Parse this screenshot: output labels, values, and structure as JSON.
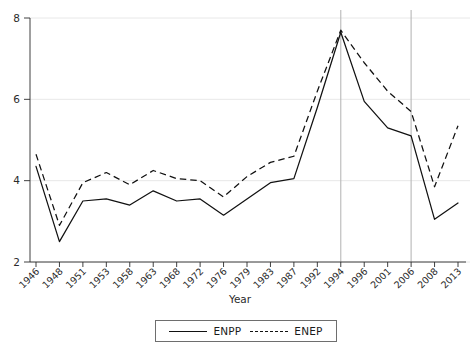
{
  "chart_data": {
    "type": "line",
    "title": "",
    "xlabel": "Year",
    "ylabel": "",
    "grid": true,
    "legend_position": "bottom",
    "ylim": [
      2,
      8
    ],
    "yticks": [
      2,
      4,
      6,
      8
    ],
    "categories": [
      "1946",
      "1948",
      "1951",
      "1953",
      "1958",
      "1963",
      "1968",
      "1972",
      "1976",
      "1979",
      "1983",
      "1987",
      "1992",
      "1994",
      "1996",
      "2001",
      "2006",
      "2008",
      "2013"
    ],
    "reference_lines": [
      "1994",
      "2006"
    ],
    "series": [
      {
        "name": "ENPP",
        "style": "solid",
        "values": [
          4.35,
          2.5,
          3.5,
          3.55,
          3.4,
          3.75,
          3.5,
          3.55,
          3.15,
          3.55,
          3.95,
          4.05,
          5.8,
          7.65,
          5.95,
          5.3,
          5.1,
          3.05,
          3.45
        ]
      },
      {
        "name": "ENEP",
        "style": "dashed",
        "values": [
          4.65,
          2.9,
          3.95,
          4.2,
          3.9,
          4.25,
          4.05,
          4.0,
          3.6,
          4.1,
          4.45,
          4.6,
          6.2,
          7.7,
          6.9,
          6.2,
          5.7,
          3.85,
          5.35
        ]
      }
    ],
    "colors": {
      "series_line": "#111111",
      "grid": "#e2e2e2",
      "axis": "#2b2b2b",
      "reference_line": "#b8b8b8",
      "background": "#ffffff"
    }
  },
  "legend": {
    "entries": [
      {
        "label": "ENPP",
        "style": "solid"
      },
      {
        "label": "ENEP",
        "style": "dashed"
      }
    ]
  }
}
